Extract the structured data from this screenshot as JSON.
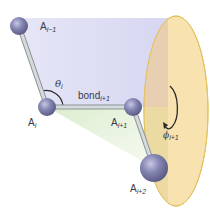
{
  "diagram": {
    "atoms": [
      {
        "id": "a_im1",
        "label": "A",
        "sub": "i−1",
        "cx": 19,
        "cy": 26,
        "r": 9
      },
      {
        "id": "a_i",
        "label": "A",
        "sub": "i",
        "cx": 47,
        "cy": 107,
        "r": 9
      },
      {
        "id": "a_ip1",
        "label": "A",
        "sub": "i+1",
        "cx": 133,
        "cy": 107,
        "r": 9
      },
      {
        "id": "a_ip2",
        "label": "A",
        "sub": "i+2",
        "cx": 154,
        "cy": 168,
        "r": 14
      }
    ],
    "bond_label": {
      "text": "bond",
      "sub": "i+1"
    },
    "angle_label": {
      "symbol": "θ",
      "sub": "i"
    },
    "dihedral_label": {
      "symbol": "ϕ",
      "sub": "i+1"
    },
    "colors": {
      "atom": "#7b7ba8",
      "atom_highlight": "#b9b9d8",
      "bond": "#c9cfd2",
      "plane_purple": "#dcdcf4",
      "plane_green": "#e3f0d6",
      "disk_fill": "#f8e3b0",
      "disk_left": "#ecd6a6",
      "disk_upper_tint": "#e6cfb6",
      "disk_edge": "#e2c25e",
      "arc": "#2a2a2a"
    }
  }
}
